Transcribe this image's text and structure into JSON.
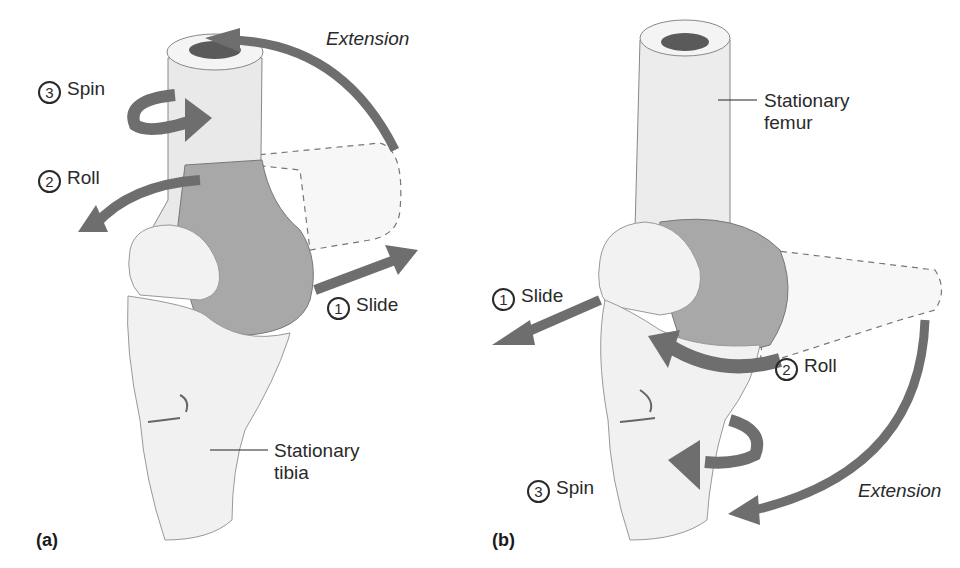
{
  "figure": {
    "panels": [
      {
        "tag": "(a)",
        "stationary_bone": "Stationary tibia",
        "stationary_line1": "Stationary",
        "stationary_line2": "tibia",
        "motion": "Extension",
        "steps": [
          {
            "num": "1",
            "label": "Slide"
          },
          {
            "num": "2",
            "label": "Roll"
          },
          {
            "num": "3",
            "label": "Spin"
          }
        ]
      },
      {
        "tag": "(b)",
        "stationary_bone": "Stationary femur",
        "stationary_line1": "Stationary",
        "stationary_line2": "femur",
        "motion": "Extension",
        "steps": [
          {
            "num": "1",
            "label": "Slide"
          },
          {
            "num": "2",
            "label": "Roll"
          },
          {
            "num": "3",
            "label": "Spin"
          }
        ]
      }
    ],
    "colors": {
      "arrow": "#6e6e6e",
      "bone_light": "#ececec",
      "bone_shaded": "#a9a9a9",
      "outline": "#555555"
    }
  }
}
